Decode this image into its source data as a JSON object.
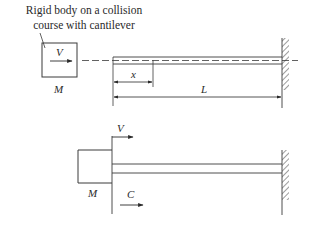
{
  "caption": {
    "line1": "Rigid body on a collision",
    "line2": "course with cantilever"
  },
  "top_figure": {
    "velocity_label": "V",
    "mass_label": "M",
    "position_label": "x",
    "length_label": "L"
  },
  "bottom_figure": {
    "velocity_label": "V",
    "mass_label": "M",
    "contact_label": "C"
  },
  "colors": {
    "stroke": "#3a3a3a",
    "background": "#ffffff"
  }
}
